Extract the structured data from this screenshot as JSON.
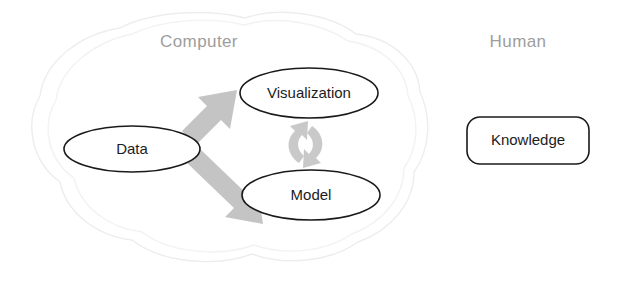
{
  "diagram": {
    "background_color": "#ffffff",
    "regions": [
      {
        "id": "computer",
        "label": "Computer",
        "label_color": "#9d9d9d",
        "boundary": "cloud"
      },
      {
        "id": "human",
        "label": "Human",
        "label_color": "#9d9d9d",
        "boundary": "none"
      }
    ],
    "nodes": [
      {
        "id": "data",
        "label": "Data",
        "shape": "ellipse",
        "region": "computer",
        "stroke_color": "#1a1a1a",
        "fill_color": "#ffffff"
      },
      {
        "id": "visualization",
        "label": "Visualization",
        "shape": "ellipse",
        "region": "computer",
        "stroke_color": "#1a1a1a",
        "fill_color": "#ffffff"
      },
      {
        "id": "model",
        "label": "Model",
        "shape": "ellipse",
        "region": "computer",
        "stroke_color": "#1a1a1a",
        "fill_color": "#ffffff"
      },
      {
        "id": "knowledge",
        "label": "Knowledge",
        "shape": "rounded-rectangle",
        "region": "human",
        "stroke_color": "#1a1a1a",
        "fill_color": "#ffffff"
      }
    ],
    "edges": [
      {
        "id": "data-to-visualization",
        "from": "data",
        "to": "visualization",
        "style": "block-arrow",
        "color": "#c4c4c4",
        "direction": "one-way"
      },
      {
        "id": "data-to-model",
        "from": "data",
        "to": "model",
        "style": "block-arrow",
        "color": "#c4c4c4",
        "direction": "one-way"
      },
      {
        "id": "visualization-model-cycle",
        "from": "visualization",
        "to": "model",
        "style": "cycle-arrow",
        "color": "#c9c9c9",
        "direction": "two-way"
      }
    ]
  }
}
